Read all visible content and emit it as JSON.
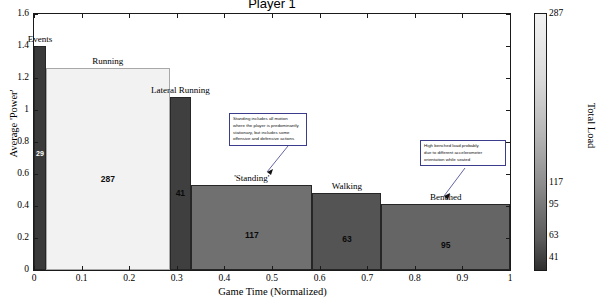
{
  "chart_data": {
    "type": "bar",
    "title": "Player 1",
    "xlabel": "Game Time (Normalized)",
    "ylabel": "Average 'Power'",
    "xlim": [
      0,
      1
    ],
    "ylim": [
      0,
      1.6
    ],
    "grid": false,
    "xticks": [
      "0",
      "0.1",
      "0.2",
      "0.3",
      "0.4",
      "0.5",
      "0.6",
      "0.7",
      "0.8",
      "0.9",
      "1"
    ],
    "yticks": [
      "0",
      "0.2",
      "0.4",
      "0.6",
      "0.8",
      "1",
      "1.2",
      "1.4",
      "1.6"
    ],
    "note": "Variable-width stacked-in-time bars; bar width = fraction of game time, bar height = average 'Power', fill shade = Total Load",
    "bars": [
      {
        "label": "Events",
        "x_start": 0.0,
        "x_end": 0.025,
        "height": 1.4,
        "total_load": 29,
        "value_label": "29",
        "color": "#3a3a3a"
      },
      {
        "label": "Running",
        "x_start": 0.025,
        "x_end": 0.285,
        "height": 1.26,
        "total_load": 287,
        "value_label": "287",
        "color": "#f2f2f2"
      },
      {
        "label": "Lateral Running",
        "x_start": 0.285,
        "x_end": 0.33,
        "height": 1.08,
        "total_load": 41,
        "value_label": "41",
        "color": "#3f3f3f"
      },
      {
        "label": "'Standing'",
        "x_start": 0.33,
        "x_end": 0.585,
        "height": 0.53,
        "total_load": 117,
        "value_label": "117",
        "color": "#707070"
      },
      {
        "label": "Walking",
        "x_start": 0.585,
        "x_end": 0.73,
        "height": 0.48,
        "total_load": 63,
        "value_label": "63",
        "color": "#545454"
      },
      {
        "label": "Benched",
        "x_start": 0.73,
        "x_end": 1.0,
        "height": 0.41,
        "total_load": 95,
        "value_label": "95",
        "color": "#656565"
      }
    ],
    "colorbar": {
      "title": "Total Load",
      "ticks": [
        "287",
        "117",
        "95",
        "63",
        "41"
      ],
      "tick_values": [
        287,
        117,
        95,
        63,
        41
      ],
      "min": 29,
      "max": 287,
      "position": "right"
    },
    "annotations": [
      {
        "id": "standing-note",
        "text": "Standing includes all motion where the player is predominantly stationary, but includes some offensive and defensive actions",
        "lines": [
          "Standing includes all motion",
          "where the player is predominantly",
          "stationary, but includes some",
          "offensive and defensive actions"
        ],
        "points_to": "'Standing'"
      },
      {
        "id": "benched-note",
        "text": "High benched load probably due to different accelerometer orientation while seated",
        "lines": [
          "High benched load probably",
          "due to different accelerometer",
          "orientation while seated"
        ],
        "points_to": "Benched"
      }
    ]
  }
}
